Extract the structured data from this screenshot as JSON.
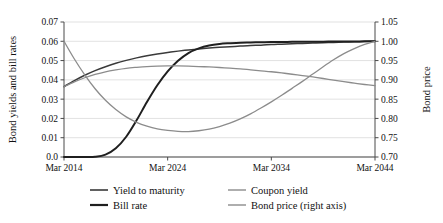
{
  "chart_data": {
    "type": "line",
    "title": "",
    "subtitle": "",
    "xlabel": "",
    "ylabel": "Bond yields and bill rates",
    "y2label": "Bond price",
    "grid": true,
    "legend_position": "bottom",
    "x_tick_labels": [
      "Mar 2014",
      "Mar 2024",
      "Mar 2034",
      "Mar 2044"
    ],
    "x_tick_values": [
      2014,
      2024,
      2034,
      2044
    ],
    "xlim": [
      2014,
      2044
    ],
    "ylim": [
      0.0,
      0.07
    ],
    "y_tick_labels": [
      "0.0",
      "0.01",
      "0.02",
      "0.03",
      "0.04",
      "0.05",
      "0.06",
      "0.07"
    ],
    "y_tick_values": [
      0.0,
      0.01,
      0.02,
      0.03,
      0.04,
      0.05,
      0.06,
      0.07
    ],
    "y2lim": [
      0.7,
      1.05
    ],
    "y2_tick_labels": [
      "0.70",
      "0.75",
      "0.80",
      "0.85",
      "0.90",
      "0.95",
      "1.00",
      "1.05"
    ],
    "y2_tick_values": [
      0.7,
      0.75,
      0.8,
      0.85,
      0.9,
      0.95,
      1.0,
      1.05
    ],
    "x": [
      2014,
      2015,
      2016,
      2017,
      2018,
      2019,
      2020,
      2021,
      2022,
      2023,
      2024,
      2025,
      2026,
      2027,
      2028,
      2029,
      2030,
      2031,
      2032,
      2033,
      2034,
      2035,
      2036,
      2037,
      2038,
      2039,
      2040,
      2041,
      2042,
      2043,
      2044
    ],
    "series": [
      {
        "name": "Yield to maturity",
        "axis": "left",
        "color": "#3a3a3a",
        "width": 1.5,
        "values": [
          0.0365,
          0.0396,
          0.0424,
          0.0448,
          0.0468,
          0.0486,
          0.0501,
          0.0514,
          0.0525,
          0.0534,
          0.0542,
          0.0549,
          0.0555,
          0.056,
          0.0565,
          0.0569,
          0.0572,
          0.0575,
          0.0578,
          0.058,
          0.0583,
          0.0585,
          0.0587,
          0.0589,
          0.0591,
          0.0593,
          0.0594,
          0.0596,
          0.0597,
          0.0599,
          0.06
        ]
      },
      {
        "name": "Bill rate",
        "axis": "left",
        "color": "#1f1f1f",
        "width": 2.0,
        "values": [
          0.0,
          0.0,
          0.0,
          0.0001,
          0.0012,
          0.0045,
          0.0105,
          0.019,
          0.0285,
          0.0372,
          0.0444,
          0.0499,
          0.0539,
          0.0563,
          0.0578,
          0.0586,
          0.059,
          0.0593,
          0.0594,
          0.0595,
          0.0596,
          0.0596,
          0.0597,
          0.0597,
          0.0598,
          0.0598,
          0.0599,
          0.0599,
          0.0599,
          0.06,
          0.06
        ]
      },
      {
        "name": "Coupon yield",
        "axis": "left",
        "color": "#8c8c8c",
        "width": 1.3,
        "values": [
          0.0365,
          0.039,
          0.0411,
          0.0428,
          0.0442,
          0.0452,
          0.046,
          0.0465,
          0.0469,
          0.0471,
          0.0472,
          0.0472,
          0.0471,
          0.0469,
          0.0467,
          0.0464,
          0.0461,
          0.0457,
          0.0452,
          0.0447,
          0.0442,
          0.0436,
          0.0429,
          0.0422,
          0.0415,
          0.0407,
          0.0399,
          0.0391,
          0.0383,
          0.0376,
          0.037
        ]
      },
      {
        "name": "Bond price (right axis)",
        "axis": "right",
        "color": "#8c8c8c",
        "width": 1.3,
        "values": [
          1.0,
          0.954,
          0.913,
          0.877,
          0.847,
          0.823,
          0.804,
          0.79,
          0.78,
          0.773,
          0.769,
          0.7665,
          0.766,
          0.768,
          0.772,
          0.779,
          0.788,
          0.799,
          0.812,
          0.827,
          0.843,
          0.86,
          0.878,
          0.896,
          0.915,
          0.934,
          0.952,
          0.968,
          0.981,
          0.992,
          1.0
        ]
      }
    ],
    "legend": [
      {
        "label": "Yield to maturity",
        "color": "#3a3a3a",
        "width": 1.6
      },
      {
        "label": "Coupon yield",
        "color": "#8c8c8c",
        "width": 1.4
      },
      {
        "label": "Bill rate",
        "color": "#1f1f1f",
        "width": 2.2
      },
      {
        "label": "Bond price (right axis)",
        "color": "#8c8c8c",
        "width": 1.4
      }
    ]
  }
}
